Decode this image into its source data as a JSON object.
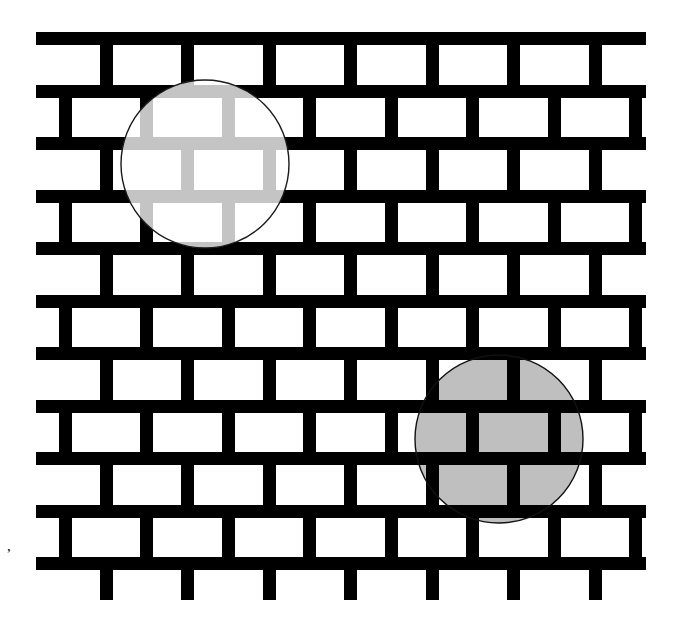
{
  "figure": {
    "width": 680,
    "height": 629,
    "background_color": "#ffffff"
  },
  "wall": {
    "name": "running-bond-brick-wall",
    "mortar_color": "#000000",
    "brick_face_color": "#ffffff",
    "origin_x": 36,
    "origin_y": 32,
    "end_x": 646,
    "end_y": 600,
    "mortar_thickness": 13,
    "row_pitch": 52.5,
    "brick_pitch": 81.5,
    "row_count": 11,
    "offset_rows_half_brick": true
  },
  "overlays": [
    {
      "id": "light-circle",
      "name": "light-translucent-circle",
      "center_x": 205,
      "center_y": 164,
      "radius": 84,
      "fill_color": "#b3b3b3",
      "fill_opacity_over_mortar": 0.78,
      "outline_color": "#1a1a1a",
      "outline_width": 1.4,
      "blend_mode": "lighten",
      "description": "Lightens the black mortar inside it to light gray; white brick faces stay white"
    },
    {
      "id": "dark-circle",
      "name": "dark-translucent-circle",
      "center_x": 499,
      "center_y": 439,
      "radius": 84,
      "fill_color": "#7f7f7f",
      "fill_opacity_over_brick": 0.5,
      "outline_color": "#111111",
      "outline_width": 1.4,
      "blend_mode": "multiply",
      "description": "Darkens the white brick faces inside it to mid gray; black mortar stays black"
    }
  ],
  "artifacts": [
    {
      "id": "stray-mark",
      "name": "stray-comma-mark",
      "x": 7,
      "y": 551,
      "color": "#000000",
      "label": ","
    }
  ],
  "legend": {
    "light_gray_hex": "#b3b3b3",
    "mid_gray_hex": "#808080",
    "black_hex": "#000000",
    "white_hex": "#ffffff"
  }
}
